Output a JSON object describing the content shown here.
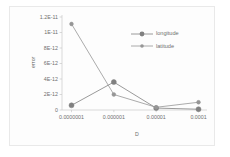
{
  "chart_data": {
    "type": "line",
    "title": "",
    "xlabel": "D",
    "ylabel": "error",
    "categories": [
      "0.0000001",
      "0.000001",
      "0.00001",
      "0.0001"
    ],
    "x_values": [
      1e-07,
      1e-06,
      1e-05,
      0.0001
    ],
    "ylim": [
      0,
      1.2e-11
    ],
    "ytick_values": [
      0,
      2e-12,
      4e-12,
      6e-12,
      8e-12,
      1e-11,
      1.2e-11
    ],
    "ytick_labels": [
      "0",
      "2E-12",
      "4E-12",
      "6E-12",
      "8E-12",
      "1E-11",
      "1.2E-11"
    ],
    "grid": false,
    "legend_position": "upper-right",
    "series": [
      {
        "name": "longitude",
        "marker": "filled-circle-large",
        "color": "#808080",
        "values": [
          6e-13,
          3.6e-12,
          2.5e-13,
          1e-13
        ]
      },
      {
        "name": "latitude",
        "marker": "filled-circle-small",
        "color": "#969696",
        "values": [
          1.11e-11,
          2e-12,
          3.5e-13,
          1e-12
        ]
      }
    ]
  },
  "axes": {
    "y_title": "error",
    "x_title": "D"
  },
  "legend": {
    "entries": [
      {
        "label": "longitude"
      },
      {
        "label": "latitude"
      }
    ]
  },
  "colors": {
    "series_longitude": "#808080",
    "series_latitude": "#969696",
    "axis_line": "#c8c8c8",
    "tick_text": "#6f6f6f",
    "frame_border": "#e9e9e9",
    "plot_background": "#fdfdfd"
  }
}
